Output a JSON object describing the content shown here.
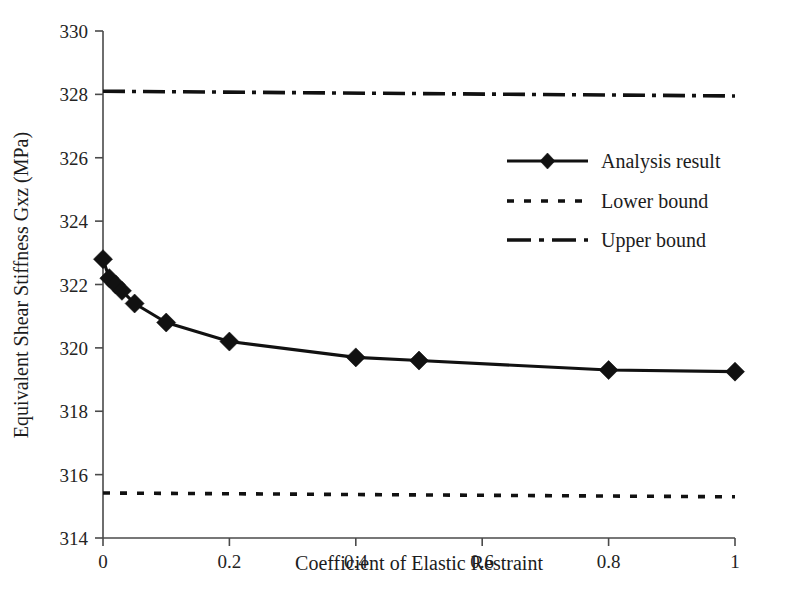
{
  "chart_data": {
    "type": "line",
    "title": "",
    "xlabel": "Coefficient of Elastic Restraint",
    "ylabel": "Equivalent Shear Stiffness Gxz (MPa)",
    "xlim": [
      0,
      1
    ],
    "ylim": [
      314,
      330
    ],
    "xticks": [
      "0",
      "0.2",
      "0.4",
      "0.6",
      "0.8",
      "1"
    ],
    "xtick_values": [
      0,
      0.2,
      0.4,
      0.6,
      0.8,
      1
    ],
    "yticks": [
      "314",
      "316",
      "318",
      "320",
      "322",
      "324",
      "326",
      "328",
      "330"
    ],
    "ytick_values": [
      314,
      316,
      318,
      320,
      322,
      324,
      326,
      328,
      330
    ],
    "grid": false,
    "legend_position": "upper right",
    "series": [
      {
        "name": "Analysis result",
        "style": "solid-with-diamond-markers",
        "color": "#111111",
        "x": [
          0,
          0.01,
          0.02,
          0.03,
          0.05,
          0.1,
          0.2,
          0.4,
          0.5,
          0.8,
          1
        ],
        "values": [
          322.8,
          322.2,
          322.0,
          321.8,
          321.4,
          320.8,
          320.2,
          319.7,
          319.6,
          319.3,
          319.25
        ]
      },
      {
        "name": "Lower bound",
        "style": "dotted",
        "color": "#111111",
        "x": [
          0,
          1
        ],
        "values": [
          315.42,
          315.3
        ]
      },
      {
        "name": "Upper bound",
        "style": "dash-dot",
        "color": "#111111",
        "x": [
          0,
          1
        ],
        "values": [
          328.1,
          327.95
        ]
      }
    ]
  },
  "legend": {
    "items": [
      {
        "label": "Analysis result",
        "style": "solid-marker"
      },
      {
        "label": "Lower bound",
        "style": "dotted"
      },
      {
        "label": "Upper bound",
        "style": "dash-dot"
      }
    ]
  },
  "colors": {
    "ink": "#111111",
    "axis": "#4a4a4a",
    "background": "#ffffff"
  }
}
